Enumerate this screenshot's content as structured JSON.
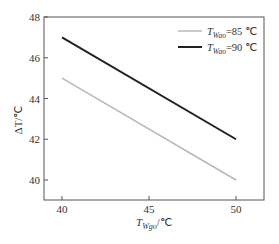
{
  "chart_data": {
    "type": "line",
    "title": "",
    "xlabel": "T_Wgo/℃",
    "ylabel": "ΔT/℃",
    "xlim": [
      39,
      51
    ],
    "ylim": [
      39,
      48
    ],
    "x_ticks": [
      40,
      45,
      50
    ],
    "y_ticks": [
      40,
      42,
      44,
      46,
      48
    ],
    "grid": false,
    "legend_position": "upper right",
    "x": [
      40,
      50
    ],
    "series": [
      {
        "name": "T_Wao=85 ℃",
        "values": [
          45,
          40
        ],
        "color": "#b8b8b8"
      },
      {
        "name": "T_Wao=90 ℃",
        "values": [
          47,
          42
        ],
        "color": "#222222"
      }
    ]
  },
  "labels": {
    "y_axis": {
      "main": "ΔT/℃"
    },
    "x_axis": {
      "T": "T",
      "sub": "Wgo",
      "unit": "/℃"
    },
    "legend": [
      {
        "T": "T",
        "sub": "Wao",
        "rest": "=85 ℃"
      },
      {
        "T": "T",
        "sub": "Wao",
        "rest": "=90 ℃"
      }
    ],
    "x_ticks": [
      "40",
      "45",
      "50"
    ],
    "y_ticks": [
      "40",
      "42",
      "44",
      "46",
      "48"
    ]
  }
}
